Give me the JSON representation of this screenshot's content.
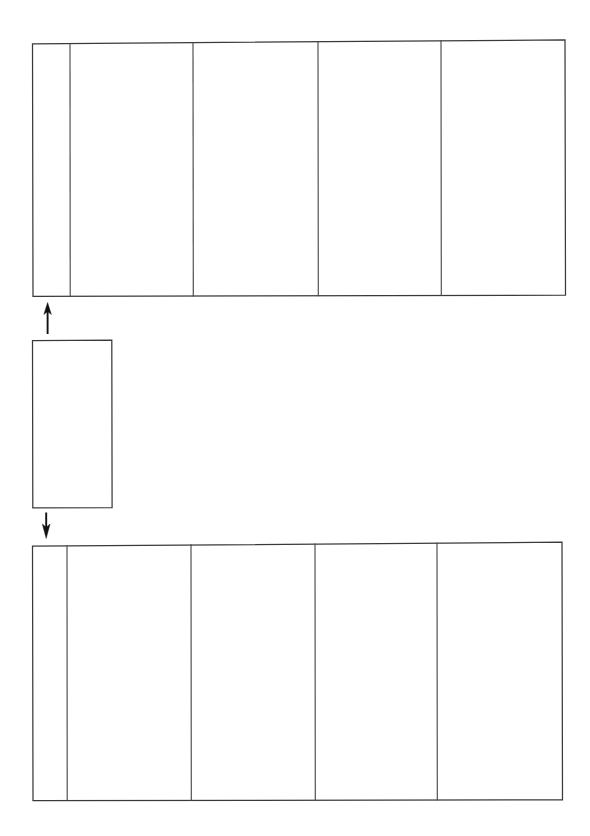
{
  "document": {
    "kind": "blank-form-flow-diagram",
    "background_color": "#ffffff",
    "ink_color": "#3a3a3a",
    "arrow_color": "#111111",
    "width": 590,
    "height": 836
  },
  "top_table": {
    "label": "",
    "column_count": 5,
    "row_count": 1,
    "columns": [
      {
        "name": "column-1",
        "header": "",
        "width_px": 38
      },
      {
        "name": "column-2",
        "header": "",
        "width_px": 123
      },
      {
        "name": "column-3",
        "header": "",
        "width_px": 125
      },
      {
        "name": "column-4",
        "header": "",
        "width_px": 123
      },
      {
        "name": "column-5",
        "header": "",
        "width_px": 124
      }
    ],
    "rows": [
      {
        "cells": [
          "",
          "",
          "",
          "",
          ""
        ]
      }
    ]
  },
  "middle_box": {
    "label": "",
    "text": "",
    "column_count": 1,
    "row_count": 1
  },
  "bottom_table": {
    "label": "",
    "column_count": 5,
    "row_count": 1,
    "columns": [
      {
        "name": "column-1",
        "header": "",
        "width_px": 35
      },
      {
        "name": "column-2",
        "header": "",
        "width_px": 124
      },
      {
        "name": "column-3",
        "header": "",
        "width_px": 124
      },
      {
        "name": "column-4",
        "header": "",
        "width_px": 122
      },
      {
        "name": "column-5",
        "header": "",
        "width_px": 125
      }
    ],
    "rows": [
      {
        "cells": [
          "",
          "",
          "",
          "",
          ""
        ]
      }
    ]
  },
  "connectors": [
    {
      "name": "arrow-up-to-top-table",
      "direction": "up",
      "label": "",
      "from": "middle_box",
      "to": "top_table"
    },
    {
      "name": "arrow-down-to-bottom-table",
      "direction": "down",
      "label": "",
      "from": "middle_box",
      "to": "bottom_table"
    }
  ]
}
